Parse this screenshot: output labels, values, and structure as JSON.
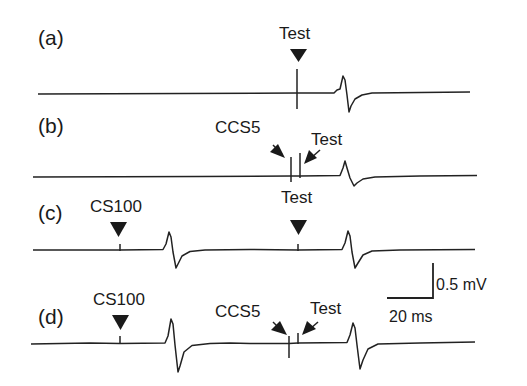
{
  "figure": {
    "panels": [
      {
        "id": "a",
        "label": "(a)",
        "markers": [
          {
            "text": "Test",
            "type": "down-arrow"
          }
        ]
      },
      {
        "id": "b",
        "label": "(b)",
        "markers": [
          {
            "text": "CCS5",
            "type": "diagonal-arrow-right"
          },
          {
            "text": "Test",
            "type": "diagonal-arrow-left"
          }
        ]
      },
      {
        "id": "c",
        "label": "(c)",
        "markers": [
          {
            "text": "CS100",
            "type": "down-arrow"
          },
          {
            "text": "Test",
            "type": "down-arrow"
          }
        ]
      },
      {
        "id": "d",
        "label": "(d)",
        "markers": [
          {
            "text": "CS100",
            "type": "down-arrow"
          },
          {
            "text": "CCS5",
            "type": "diagonal-arrow-right"
          },
          {
            "text": "Test",
            "type": "diagonal-arrow-left"
          }
        ]
      }
    ],
    "scale_bar": {
      "vertical": "0.5 mV",
      "horizontal": "20 ms"
    }
  }
}
